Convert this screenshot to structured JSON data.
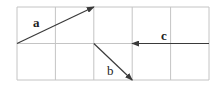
{
  "diagram": {
    "type": "vector-grid",
    "grid": {
      "columns": 5,
      "rows": 2,
      "origin_px": [
        17,
        7
      ],
      "cell_width_px": 38.4,
      "cell_height_px": 36.5,
      "line_color": "#c4c4c4"
    },
    "vectors": [
      {
        "label": "a",
        "from_cell": [
          0,
          1
        ],
        "to_cell": [
          2,
          0
        ],
        "label_pos_px": [
          33,
          27
        ],
        "bold": true
      },
      {
        "label": "b",
        "from_cell": [
          2,
          1
        ],
        "to_cell": [
          3,
          2
        ],
        "label_pos_px": [
          107,
          75
        ],
        "bold": false
      },
      {
        "label": "c",
        "from_cell": [
          5,
          1
        ],
        "to_cell": [
          3,
          1
        ],
        "label_pos_px": [
          161,
          40
        ],
        "bold": true
      }
    ],
    "vector_color": "#3a3a3a"
  }
}
